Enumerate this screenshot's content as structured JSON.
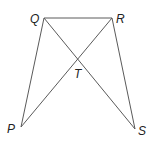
{
  "diagram": {
    "type": "geometry-figure",
    "line_color": "#5a5a5a",
    "label_color": "#222222",
    "points": {
      "Q": {
        "label": "Q",
        "x": 44,
        "y": 18,
        "label_x": 30,
        "label_y": 23
      },
      "R": {
        "label": "R",
        "x": 112,
        "y": 18,
        "label_x": 116,
        "label_y": 23
      },
      "T": {
        "label": "T",
        "x": 78,
        "y": 60,
        "label_x": 74,
        "label_y": 78
      },
      "P": {
        "label": "P",
        "x": 21,
        "y": 127,
        "label_x": 7,
        "label_y": 133
      },
      "S": {
        "label": "S",
        "x": 135,
        "y": 129,
        "label_x": 138,
        "label_y": 135
      }
    },
    "segments": [
      {
        "name": "QR",
        "from": "Q",
        "to": "R"
      },
      {
        "name": "QP",
        "from": "Q",
        "to": "P"
      },
      {
        "name": "QS",
        "from": "Q",
        "to": "S"
      },
      {
        "name": "RP",
        "from": "R",
        "to": "P"
      },
      {
        "name": "RS",
        "from": "R",
        "to": "S"
      }
    ]
  }
}
